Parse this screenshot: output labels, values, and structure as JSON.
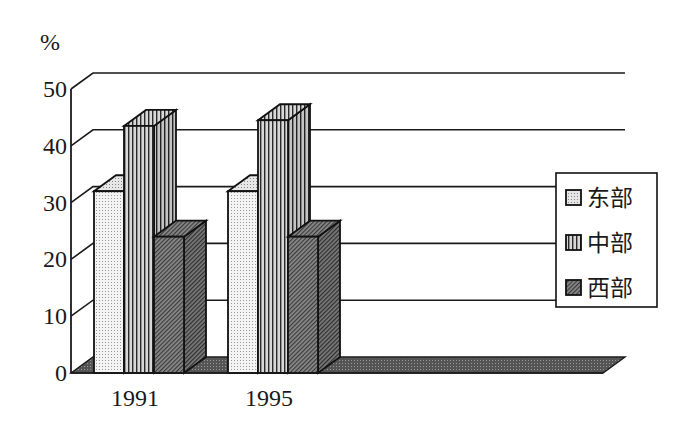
{
  "chart_data": {
    "type": "bar",
    "style": "3d-clustered-column",
    "title": "",
    "xlabel": "",
    "ylabel": "%",
    "ylim": [
      0,
      50
    ],
    "yticks": [
      0,
      10,
      20,
      30,
      40,
      50
    ],
    "grid": true,
    "legend_position": "right",
    "categories": [
      "1991",
      "1995"
    ],
    "series": [
      {
        "name": "东部",
        "values": [
          32,
          32
        ],
        "pattern": "dots"
      },
      {
        "name": "中部",
        "values": [
          43.5,
          44.5
        ],
        "pattern": "vertical-lines"
      },
      {
        "name": "西部",
        "values": [
          24,
          24
        ],
        "pattern": "diagonal-hatch"
      }
    ]
  },
  "axis": {
    "unit": "%",
    "ticks": [
      "0",
      "10",
      "20",
      "30",
      "40",
      "50"
    ]
  },
  "legend": {
    "items": [
      "东部",
      "中部",
      "西部"
    ]
  },
  "categories": [
    "1991",
    "1995"
  ]
}
